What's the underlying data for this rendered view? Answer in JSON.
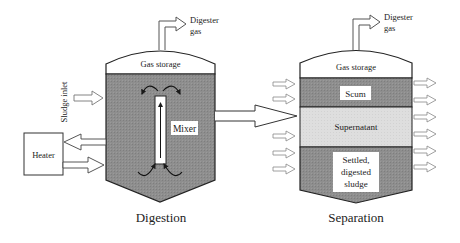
{
  "diagram": {
    "type": "anaerobic-digester-process",
    "colors": {
      "tank_fill": "#8c8c8c",
      "supernatant_fill": "#dcdcdc",
      "outline": "#2a2a2a",
      "label_bg": "#ffffff",
      "arrow_fill": "#ffffff"
    },
    "digestion_tank": {
      "title": "Digestion",
      "gas_storage_label": "Gas storage",
      "gas_output_label_line1": "Digester",
      "gas_output_label_line2": "gas",
      "mixer_label": "Mixer",
      "sludge_inlet_label": "Sludge inlet",
      "heater_label": "Heater"
    },
    "separation_tank": {
      "title": "Separation",
      "gas_storage_label": "Gas storage",
      "gas_output_label_line1": "Digester",
      "gas_output_label_line2": "gas",
      "layers": [
        {
          "label": "Scum"
        },
        {
          "label": "Supernatant"
        },
        {
          "label_line1": "Settled,",
          "label_line2": "digested",
          "label_line3": "sludge"
        }
      ]
    }
  }
}
